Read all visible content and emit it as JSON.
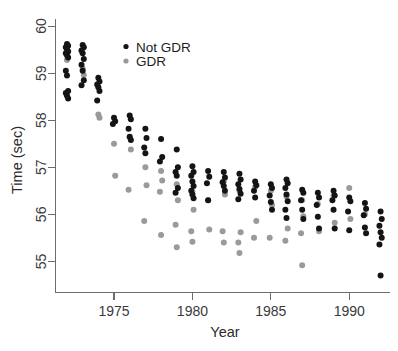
{
  "chart_data": {
    "type": "scatter",
    "title": "",
    "xlabel": "Year",
    "ylabel": "Time (sec)",
    "xlim": [
      1971.3,
      1992.6
    ],
    "ylim": [
      54.35,
      60.15
    ],
    "xticks": [
      1975,
      1980,
      1985,
      1990
    ],
    "yticks": [
      55,
      56,
      57,
      58,
      59,
      60
    ],
    "grid": false,
    "legend_position": "top-center",
    "colors": {
      "not_gdr": "#141414",
      "gdr": "#9a9a9a",
      "axis": "#6d6d6d",
      "text": "#2b2b2b",
      "background": "#ffffff"
    },
    "series": [
      {
        "name": "Not GDR",
        "color": "#141414",
        "points": [
          [
            1972,
            59.62
          ],
          [
            1972,
            59.58
          ],
          [
            1972,
            59.55
          ],
          [
            1972,
            59.5
          ],
          [
            1972,
            59.46
          ],
          [
            1972,
            59.42
          ],
          [
            1972,
            59.38
          ],
          [
            1972,
            59.33
          ],
          [
            1972,
            59.05
          ],
          [
            1972,
            58.95
          ],
          [
            1972,
            58.62
          ],
          [
            1972,
            58.58
          ],
          [
            1972,
            58.52
          ],
          [
            1972,
            58.46
          ],
          [
            1973,
            59.6
          ],
          [
            1973,
            59.55
          ],
          [
            1973,
            59.48
          ],
          [
            1973,
            59.42
          ],
          [
            1973,
            59.3
          ],
          [
            1973,
            59.18
          ],
          [
            1973,
            59.05
          ],
          [
            1973,
            58.85
          ],
          [
            1973,
            58.74
          ],
          [
            1974,
            58.9
          ],
          [
            1974,
            58.82
          ],
          [
            1974,
            58.76
          ],
          [
            1974,
            58.7
          ],
          [
            1974,
            58.62
          ],
          [
            1974,
            58.42
          ],
          [
            1975,
            58.05
          ],
          [
            1975,
            57.98
          ],
          [
            1975,
            57.92
          ],
          [
            1976,
            58.1
          ],
          [
            1976,
            58.02
          ],
          [
            1976,
            57.82
          ],
          [
            1976,
            57.65
          ],
          [
            1976,
            57.58
          ],
          [
            1977,
            57.82
          ],
          [
            1977,
            57.62
          ],
          [
            1977,
            57.42
          ],
          [
            1977,
            57.3
          ],
          [
            1978,
            57.6
          ],
          [
            1978,
            57.22
          ],
          [
            1978,
            57.12
          ],
          [
            1979,
            57.38
          ],
          [
            1979,
            57.0
          ],
          [
            1979,
            56.9
          ],
          [
            1979,
            56.82
          ],
          [
            1979,
            56.56
          ],
          [
            1979,
            56.46
          ],
          [
            1980,
            57.02
          ],
          [
            1980,
            56.9
          ],
          [
            1980,
            56.82
          ],
          [
            1980,
            56.7
          ],
          [
            1980,
            56.6
          ],
          [
            1980,
            56.5
          ],
          [
            1980,
            56.42
          ],
          [
            1980,
            56.34
          ],
          [
            1981,
            56.92
          ],
          [
            1981,
            56.8
          ],
          [
            1981,
            56.66
          ],
          [
            1981,
            56.3
          ],
          [
            1982,
            56.9
          ],
          [
            1982,
            56.78
          ],
          [
            1982,
            56.68
          ],
          [
            1982,
            56.6
          ],
          [
            1982,
            56.5
          ],
          [
            1983,
            56.86
          ],
          [
            1983,
            56.74
          ],
          [
            1983,
            56.64
          ],
          [
            1983,
            56.54
          ],
          [
            1983,
            56.44
          ],
          [
            1983,
            56.32
          ],
          [
            1984,
            56.7
          ],
          [
            1984,
            56.62
          ],
          [
            1984,
            56.5
          ],
          [
            1984,
            56.36
          ],
          [
            1985,
            56.64
          ],
          [
            1985,
            56.56
          ],
          [
            1985,
            56.4
          ],
          [
            1985,
            56.26
          ],
          [
            1985,
            56.1
          ],
          [
            1986,
            56.74
          ],
          [
            1986,
            56.66
          ],
          [
            1986,
            56.56
          ],
          [
            1986,
            56.42
          ],
          [
            1986,
            56.28
          ],
          [
            1986,
            56.1
          ],
          [
            1986,
            55.92
          ],
          [
            1987,
            56.52
          ],
          [
            1987,
            56.46
          ],
          [
            1987,
            56.3
          ],
          [
            1987,
            56.1
          ],
          [
            1987,
            55.9
          ],
          [
            1988,
            56.46
          ],
          [
            1988,
            56.36
          ],
          [
            1988,
            56.2
          ],
          [
            1988,
            55.95
          ],
          [
            1988,
            55.7
          ],
          [
            1989,
            56.5
          ],
          [
            1989,
            56.4
          ],
          [
            1989,
            56.3
          ],
          [
            1989,
            56.1
          ],
          [
            1989,
            55.7
          ],
          [
            1990,
            56.36
          ],
          [
            1990,
            56.28
          ],
          [
            1990,
            56.06
          ],
          [
            1990,
            55.66
          ],
          [
            1991,
            56.24
          ],
          [
            1991,
            56.12
          ],
          [
            1991,
            55.98
          ],
          [
            1991,
            55.72
          ],
          [
            1991,
            55.6
          ],
          [
            1992,
            56.06
          ],
          [
            1992,
            55.9
          ],
          [
            1992,
            55.76
          ],
          [
            1992,
            55.62
          ],
          [
            1992,
            55.5
          ],
          [
            1992,
            55.36
          ],
          [
            1992,
            54.7
          ]
        ]
      },
      {
        "name": "GDR",
        "color": "#9a9a9a",
        "points": [
          [
            1972,
            59.28
          ],
          [
            1973,
            59.1
          ],
          [
            1973,
            58.96
          ],
          [
            1974,
            58.12
          ],
          [
            1974,
            58.05
          ],
          [
            1975,
            57.5
          ],
          [
            1975,
            56.82
          ],
          [
            1976,
            57.64
          ],
          [
            1976,
            57.38
          ],
          [
            1976,
            56.52
          ],
          [
            1977,
            57.0
          ],
          [
            1977,
            56.62
          ],
          [
            1977,
            55.86
          ],
          [
            1978,
            56.92
          ],
          [
            1978,
            56.72
          ],
          [
            1978,
            56.48
          ],
          [
            1978,
            55.56
          ],
          [
            1979,
            56.64
          ],
          [
            1979,
            56.3
          ],
          [
            1979,
            55.78
          ],
          [
            1979,
            55.3
          ],
          [
            1980,
            56.48
          ],
          [
            1980,
            56.1
          ],
          [
            1980,
            55.64
          ],
          [
            1980,
            55.42
          ],
          [
            1981,
            56.3
          ],
          [
            1981,
            55.68
          ],
          [
            1982,
            56.7
          ],
          [
            1982,
            56.42
          ],
          [
            1982,
            55.64
          ],
          [
            1982,
            55.4
          ],
          [
            1983,
            56.5
          ],
          [
            1983,
            55.62
          ],
          [
            1983,
            55.4
          ],
          [
            1983,
            55.18
          ],
          [
            1984,
            56.58
          ],
          [
            1984,
            55.86
          ],
          [
            1984,
            55.5
          ],
          [
            1985,
            56.5
          ],
          [
            1985,
            56.2
          ],
          [
            1985,
            55.5
          ],
          [
            1986,
            56.38
          ],
          [
            1986,
            55.7
          ],
          [
            1986,
            55.44
          ],
          [
            1987,
            56.3
          ],
          [
            1987,
            55.96
          ],
          [
            1987,
            55.6
          ],
          [
            1987,
            54.92
          ],
          [
            1988,
            56.22
          ],
          [
            1988,
            55.64
          ],
          [
            1989,
            56.4
          ],
          [
            1989,
            55.82
          ],
          [
            1990,
            56.56
          ],
          [
            1990,
            55.9
          ],
          [
            1991,
            56.0
          ]
        ]
      }
    ]
  },
  "axes": {
    "x_label": "Year",
    "y_label": "Time (sec)",
    "x_tick_labels": [
      "1975",
      "1980",
      "1985",
      "1990"
    ],
    "y_tick_labels": [
      "55",
      "56",
      "57",
      "58",
      "59",
      "60"
    ]
  },
  "legend": {
    "entries": [
      {
        "label": "Not GDR",
        "marker": "filled-circle-black"
      },
      {
        "label": "GDR",
        "marker": "filled-circle-gray"
      }
    ]
  }
}
